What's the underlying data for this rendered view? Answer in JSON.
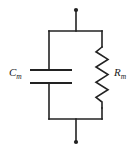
{
  "figure": {
    "background_color": "#ffffff",
    "line_color": "#222222",
    "label_color": "#1a1a1a"
  },
  "labels": {
    "capacitor": {
      "symbol": "C",
      "subscript": "m",
      "full": "Cm"
    },
    "resistor": {
      "symbol": "R",
      "subscript": "m",
      "full": "Rm"
    }
  },
  "components": [
    {
      "name": "capacitor",
      "kind": "capacitor",
      "label": "Cm",
      "branch": "left",
      "plate_span_x": [
        30,
        72
      ],
      "plate_y": [
        70,
        83
      ]
    },
    {
      "name": "resistor",
      "kind": "resistor-zigzag",
      "label": "Rm",
      "branch": "right",
      "zigzag_x_center": 102,
      "zigzag_y_range": [
        47,
        108
      ],
      "zigzag_amplitude": 7,
      "zigzag_peaks": 8
    }
  ],
  "terminals": [
    {
      "name": "top-terminal",
      "x": 76,
      "y": 10
    },
    {
      "name": "bottom-terminal",
      "x": 76,
      "y": 142
    }
  ],
  "frame": {
    "left": 49,
    "top": 31,
    "right": 102,
    "bottom": 119
  }
}
